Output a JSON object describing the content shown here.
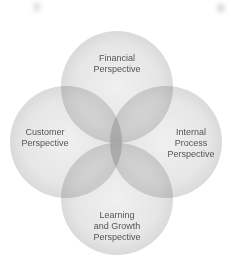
{
  "diagram": {
    "title": "",
    "type": "four-circle-venn",
    "colors": {
      "circle_fill": "#e6e6e6",
      "circle_edge": "#d6d6d6",
      "pair_overlap": "#b4b4b4",
      "center_overlap": "#8c8c8c",
      "text": "#555555"
    },
    "circles": [
      {
        "id": "financial",
        "label_lines": [
          "Financial",
          "Perspective"
        ],
        "cx": 117,
        "cy": 87,
        "r": 56
      },
      {
        "id": "customer",
        "label_lines": [
          "Customer",
          "Perspective"
        ],
        "cx": 66,
        "cy": 142,
        "r": 56
      },
      {
        "id": "internal",
        "label_lines": [
          "Internal",
          "Process",
          "Perspective"
        ],
        "cx": 166,
        "cy": 142,
        "r": 56
      },
      {
        "id": "learning",
        "label_lines": [
          "Learning",
          "and Growth",
          "Perspective"
        ],
        "cx": 117,
        "cy": 199,
        "r": 56
      }
    ]
  }
}
